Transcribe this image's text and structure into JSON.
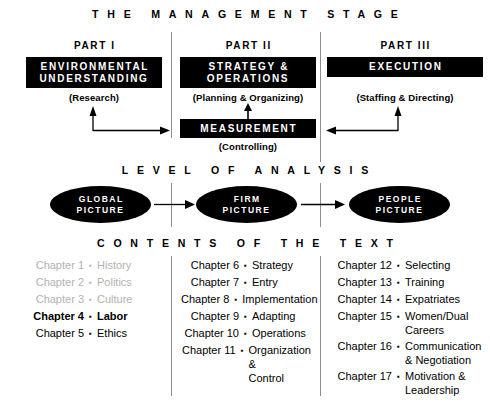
{
  "banners": {
    "management": "THE MANAGEMENT STAGE",
    "level": "LEVEL OF ANALYSIS",
    "contents": "CONTENTS OF THE TEXT"
  },
  "colors": {
    "box_fill": "#000000",
    "box_text": "#ffffff",
    "divider": "#8d8d8d",
    "dim_text": "#b2b2b2",
    "page_bg": "#ffffff"
  },
  "stage": {
    "parts": [
      {
        "part_label": "PART I",
        "box_title": "ENVIRONMENTAL\nUNDERSTANDING",
        "sublabel": "(Research)"
      },
      {
        "part_label": "PART II",
        "box_title": "STRATEGY &\nOPERATIONS",
        "sublabel": "(Planning & Organizing)"
      },
      {
        "part_label": "PART III",
        "box_title": "EXECUTION",
        "sublabel": "(Staffing & Directing)"
      }
    ],
    "measurement": {
      "box_title": "MEASUREMENT",
      "sublabel": "(Controlling)"
    }
  },
  "level_of_analysis": {
    "ovals": [
      {
        "label": "GLOBAL\nPICTURE"
      },
      {
        "label": "FIRM\nPICTURE"
      },
      {
        "label": "PEOPLE\nPICTURE"
      }
    ]
  },
  "contents": {
    "bullet_glyph": "▪",
    "columns": [
      {
        "items": [
          {
            "chapter": "Chapter 1",
            "topic": "History",
            "style": "dim"
          },
          {
            "chapter": "Chapter 2",
            "topic": "Politics",
            "style": "dim"
          },
          {
            "chapter": "Chapter 3",
            "topic": "Culture",
            "style": "dim"
          },
          {
            "chapter": "Chapter 4",
            "topic": "Labor",
            "style": "bold"
          },
          {
            "chapter": "Chapter 5",
            "topic": "Ethics",
            "style": "normal"
          }
        ]
      },
      {
        "items": [
          {
            "chapter": "Chapter 6",
            "topic": "Strategy",
            "style": "normal"
          },
          {
            "chapter": "Chapter 7",
            "topic": "Entry",
            "style": "normal"
          },
          {
            "chapter": "Chapter 8",
            "topic": "Implementation",
            "style": "normal"
          },
          {
            "chapter": "Chapter 9",
            "topic": "Adapting",
            "style": "normal"
          },
          {
            "chapter": "Chapter 10",
            "topic": "Operations",
            "style": "normal"
          },
          {
            "chapter": "Chapter 11",
            "topic": "Organization &\nControl",
            "style": "normal"
          }
        ]
      },
      {
        "items": [
          {
            "chapter": "Chapter 12",
            "topic": "Selecting",
            "style": "normal"
          },
          {
            "chapter": "Chapter 13",
            "topic": "Training",
            "style": "normal"
          },
          {
            "chapter": "Chapter 14",
            "topic": "Expatriates",
            "style": "normal"
          },
          {
            "chapter": "Chapter 15",
            "topic": "Women/Dual\nCareers",
            "style": "normal"
          },
          {
            "chapter": "Chapter 16",
            "topic": "Communication\n& Negotiation",
            "style": "normal"
          },
          {
            "chapter": "Chapter 17",
            "topic": "Motivation &\nLeadership",
            "style": "normal"
          }
        ]
      }
    ]
  }
}
